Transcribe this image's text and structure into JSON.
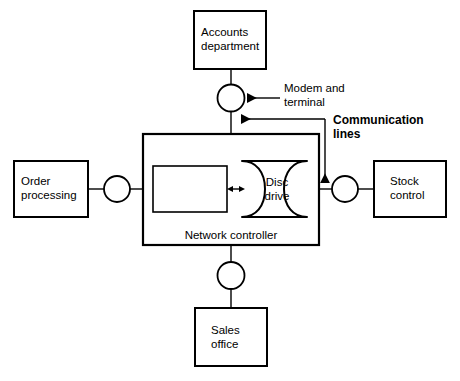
{
  "diagram": {
    "background_color": "#ffffff",
    "line_color": "#000000",
    "nodes": {
      "accounts": {
        "line1": "Accounts",
        "line2": "department"
      },
      "order_processing": {
        "line1": "Order",
        "line2": "processing"
      },
      "stock_control": {
        "line1": "Stock",
        "line2": "control"
      },
      "sales_office": {
        "line1": "Sales",
        "line2": "office"
      },
      "controller": {
        "label": "Network controller"
      },
      "disc_drive": {
        "line1": "Disc",
        "line2": "drive"
      }
    },
    "callouts": {
      "modem": {
        "line1": "Modem and",
        "line2": "terminal"
      },
      "communication": {
        "line1": "Communication",
        "line2": "lines"
      }
    }
  }
}
